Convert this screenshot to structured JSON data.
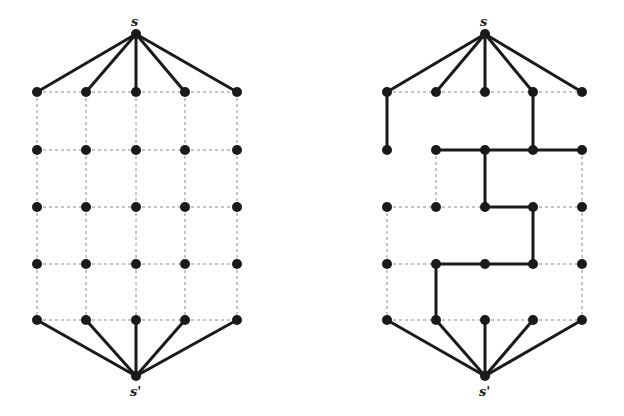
{
  "graphs": [
    {
      "id": "left",
      "source_label": "s",
      "sink_label": "s'",
      "source": [
        136,
        34
      ],
      "sink": [
        136,
        376
      ],
      "cols": [
        37,
        86,
        136,
        185,
        237
      ],
      "rows": [
        92,
        150,
        207,
        264,
        320
      ],
      "bold_grid_edges": []
    },
    {
      "id": "right",
      "source_label": "s",
      "sink_label": "s'",
      "source": [
        485,
        34
      ],
      "sink": [
        485,
        376
      ],
      "cols": [
        387,
        436,
        485,
        533,
        582
      ],
      "rows": [
        92,
        150,
        207,
        264,
        320
      ],
      "bold_grid_edges": [
        [
          [
            0,
            0
          ],
          [
            0,
            1
          ]
        ],
        [
          [
            3,
            0
          ],
          [
            3,
            1
          ]
        ],
        [
          [
            1,
            1
          ],
          [
            2,
            1
          ]
        ],
        [
          [
            2,
            1
          ],
          [
            3,
            1
          ]
        ],
        [
          [
            3,
            1
          ],
          [
            4,
            1
          ]
        ],
        [
          [
            2,
            1
          ],
          [
            2,
            2
          ]
        ],
        [
          [
            2,
            2
          ],
          [
            3,
            2
          ]
        ],
        [
          [
            3,
            2
          ],
          [
            3,
            3
          ]
        ],
        [
          [
            1,
            3
          ],
          [
            2,
            3
          ]
        ],
        [
          [
            2,
            3
          ],
          [
            3,
            3
          ]
        ],
        [
          [
            1,
            3
          ],
          [
            1,
            4
          ]
        ]
      ],
      "dotted_grid_edges": [
        [
          [
            0,
            0
          ],
          [
            1,
            0
          ]
        ],
        [
          [
            1,
            0
          ],
          [
            2,
            0
          ]
        ],
        [
          [
            2,
            0
          ],
          [
            3,
            0
          ]
        ],
        [
          [
            3,
            0
          ],
          [
            4,
            0
          ]
        ],
        [
          [
            1,
            1
          ],
          [
            1,
            2
          ]
        ],
        [
          [
            4,
            1
          ],
          [
            4,
            2
          ]
        ],
        [
          [
            0,
            2
          ],
          [
            1,
            2
          ]
        ],
        [
          [
            1,
            2
          ],
          [
            2,
            2
          ]
        ],
        [
          [
            3,
            2
          ],
          [
            4,
            2
          ]
        ],
        [
          [
            0,
            2
          ],
          [
            0,
            3
          ]
        ],
        [
          [
            4,
            2
          ],
          [
            4,
            3
          ]
        ],
        [
          [
            0,
            3
          ],
          [
            1,
            3
          ]
        ],
        [
          [
            3,
            3
          ],
          [
            4,
            3
          ]
        ],
        [
          [
            0,
            3
          ],
          [
            0,
            4
          ]
        ],
        [
          [
            4,
            3
          ],
          [
            4,
            4
          ]
        ],
        [
          [
            0,
            4
          ],
          [
            1,
            4
          ]
        ],
        [
          [
            1,
            4
          ],
          [
            2,
            4
          ]
        ],
        [
          [
            2,
            4
          ],
          [
            3,
            4
          ]
        ],
        [
          [
            3,
            4
          ],
          [
            4,
            4
          ]
        ]
      ]
    }
  ],
  "colors": {
    "edge": "#1a1a1a",
    "dotted": "#888888",
    "node": "#1a1a1a"
  }
}
